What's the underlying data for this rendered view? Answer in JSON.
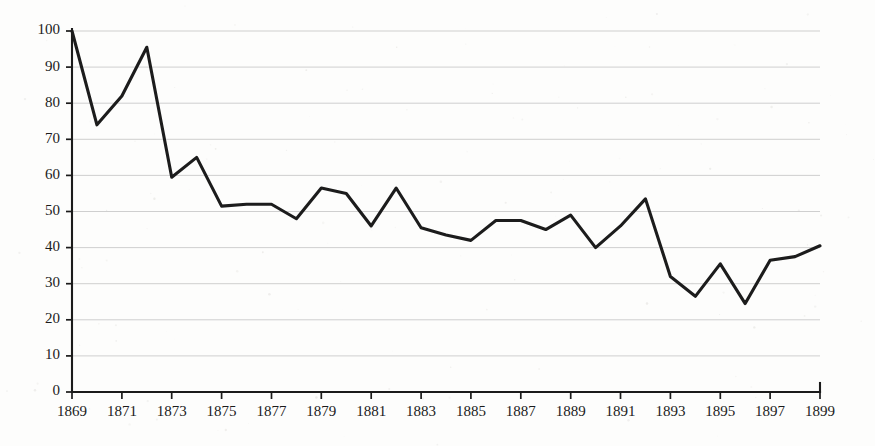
{
  "chart_data": {
    "type": "line",
    "title": "",
    "subtitle": "",
    "xlabel": "",
    "ylabel": "",
    "xlim": [
      1869,
      1899
    ],
    "ylim": [
      0,
      100
    ],
    "grid": true,
    "legend": "none",
    "x": [
      1869,
      1870,
      1871,
      1872,
      1873,
      1874,
      1875,
      1876,
      1877,
      1878,
      1879,
      1880,
      1881,
      1882,
      1883,
      1884,
      1885,
      1886,
      1887,
      1888,
      1889,
      1890,
      1891,
      1892,
      1893,
      1894,
      1895,
      1896,
      1897,
      1898,
      1899
    ],
    "series": [
      {
        "name": "index",
        "values": [
          100,
          74,
          82,
          95.5,
          59.5,
          65,
          51.5,
          52,
          52,
          48,
          56.5,
          55,
          46,
          56.5,
          45.5,
          43.5,
          42,
          47.5,
          47.5,
          45,
          49,
          40,
          46,
          53.5,
          32,
          26.5,
          35.5,
          24.5,
          36.5,
          37.5,
          40.5
        ]
      }
    ],
    "y_ticks": [
      0,
      10,
      20,
      30,
      40,
      50,
      60,
      70,
      80,
      90,
      100
    ],
    "y_tick_labels": [
      "0",
      "10",
      "20",
      "30",
      "40",
      "50",
      "60",
      "70",
      "80",
      "90",
      "100"
    ],
    "x_ticks": [
      1869,
      1871,
      1873,
      1875,
      1877,
      1879,
      1881,
      1883,
      1885,
      1887,
      1889,
      1891,
      1893,
      1895,
      1897,
      1899
    ],
    "x_tick_labels": [
      "1869",
      "1871",
      "1873",
      "1875",
      "1877",
      "1879",
      "1881",
      "1883",
      "1885",
      "1887",
      "1889",
      "1891",
      "1893",
      "1895",
      "1897",
      "1899"
    ],
    "colors": {
      "line": "#1c1c1c",
      "grid": "#c9c9c9",
      "axis": "#1b1b1b",
      "background": "#fdfdfc",
      "text": "#1b1b1b"
    }
  }
}
